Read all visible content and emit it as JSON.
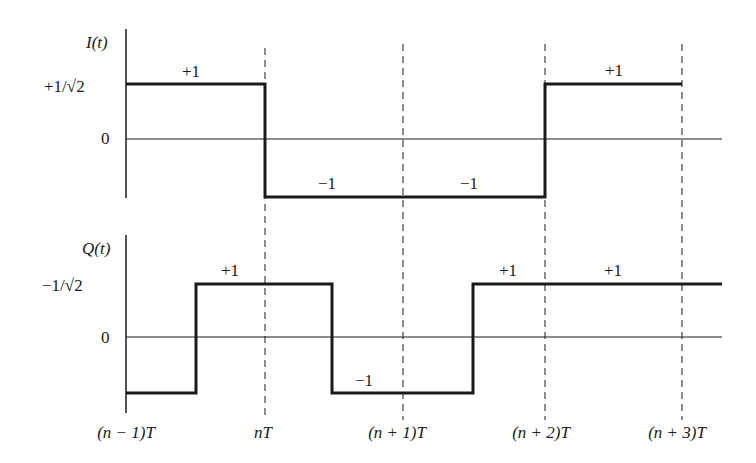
{
  "figure": {
    "type": "OQPSK / staggered QPSK in-phase and quadrature waveforms",
    "ink_color": "#1a1a1a",
    "background": "#ffffff"
  },
  "i_channel": {
    "axis_label": "I(t)",
    "level_high_label": "+1/√2",
    "zero_label": "0",
    "symbols": [
      {
        "label": "+1",
        "value": 1,
        "start": "(n - 1)T",
        "end": "nT"
      },
      {
        "label": "−1",
        "value": -1,
        "start": "nT",
        "end": "(n + 1)T"
      },
      {
        "label": "−1",
        "value": -1,
        "start": "(n + 1)T",
        "end": "(n + 2)T"
      },
      {
        "label": "+1",
        "value": 1,
        "start": "(n + 2)T",
        "end": "(n + 3)T"
      }
    ]
  },
  "q_channel": {
    "axis_label": "Q(t)",
    "level_high_label": "−1/√2",
    "zero_label": "0",
    "symbols": [
      {
        "label": "",
        "value": -1,
        "start": "(n - 1)T",
        "end": "(n - 1/2)T"
      },
      {
        "label": "+1",
        "value": 1,
        "start": "(n - 1/2)T",
        "end": "(n + 1/2)T"
      },
      {
        "label": "−1",
        "value": -1,
        "start": "(n + 1/2)T",
        "end": "(n + 3/2)T"
      },
      {
        "label": "+1",
        "value": 1,
        "start": "(n + 3/2)T",
        "end": "(n + 5/2)T"
      },
      {
        "label": "+1",
        "value": 1,
        "start": "(n + 5/2)T",
        "end": "(n + 7/2)T"
      }
    ]
  },
  "time_axis": {
    "ticks": [
      "(n − 1)T",
      "nT",
      "(n + 1)T",
      "(n + 2)T",
      "(n + 3)T"
    ]
  }
}
